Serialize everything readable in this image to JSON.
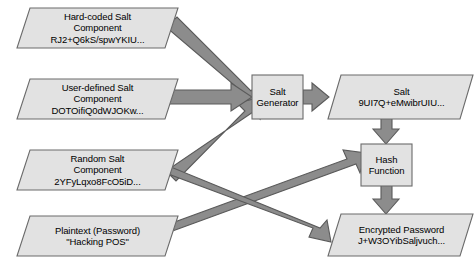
{
  "diagram": {
    "type": "flowchart",
    "colors": {
      "background": "#ffffff",
      "node_fill": "#e2e2e2",
      "node_stroke": "#6b6b6b",
      "arrow_fill": "#8c8c8c",
      "arrow_stroke": "#5a5a5a",
      "text": "#000000"
    },
    "nodes": [
      {
        "id": "hard-coded-salt",
        "shape": "parallelogram",
        "lines": [
          "Hard-coded Salt",
          "Component",
          "RJ2+Q6kS/spwYKIU..."
        ]
      },
      {
        "id": "user-defined-salt",
        "shape": "parallelogram",
        "lines": [
          "User-defined Salt",
          "Component",
          "DOTOifiQ0dWJOKw..."
        ]
      },
      {
        "id": "random-salt",
        "shape": "parallelogram",
        "lines": [
          "Random Salt",
          "Component",
          "2YFyLqxo8FcO5iD..."
        ]
      },
      {
        "id": "plaintext-password",
        "shape": "parallelogram",
        "lines": [
          "Plaintext (Password)",
          "\"Hacking POS\""
        ]
      },
      {
        "id": "salt-generator",
        "shape": "rectangle",
        "lines": [
          "Salt",
          "Generator"
        ]
      },
      {
        "id": "salt-output",
        "shape": "parallelogram",
        "lines": [
          "Salt",
          "9UI7Q+eMwibrUIU..."
        ]
      },
      {
        "id": "hash-function",
        "shape": "rectangle",
        "lines": [
          "Hash",
          "Function"
        ]
      },
      {
        "id": "encrypted-password",
        "shape": "parallelogram",
        "lines": [
          "Encrypted Password",
          "J+W3OYibSaljvuch..."
        ]
      }
    ],
    "edges": [
      {
        "id": "hardcoded-to-generator",
        "from": "hard-coded-salt",
        "to": "salt-generator"
      },
      {
        "id": "userdefined-to-generator",
        "from": "user-defined-salt",
        "to": "salt-generator"
      },
      {
        "id": "random-to-generator",
        "from": "random-salt",
        "to": "salt-generator"
      },
      {
        "id": "generator-to-salt",
        "from": "salt-generator",
        "to": "salt-output"
      },
      {
        "id": "salt-to-hash",
        "from": "salt-output",
        "to": "hash-function"
      },
      {
        "id": "random-to-hash",
        "from": "random-salt",
        "to": "hash-function"
      },
      {
        "id": "hash-to-encrypted",
        "from": "hash-function",
        "to": "encrypted-password"
      },
      {
        "id": "plaintext-to-encrypted",
        "from": "plaintext-password",
        "to": "encrypted-password"
      }
    ]
  }
}
